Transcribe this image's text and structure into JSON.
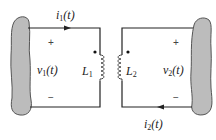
{
  "diagram": {
    "type": "coupled-inductors-circuit",
    "left_circuit": {
      "current_label": "i",
      "current_sub": "1",
      "current_arg": "(t)",
      "voltage_label": "v",
      "voltage_sub": "1",
      "voltage_arg": "(t)",
      "plus": "+",
      "minus": "−",
      "inductor_label": "L",
      "inductor_sub": "1",
      "current_direction": "right"
    },
    "right_circuit": {
      "current_label": "i",
      "current_sub": "2",
      "current_arg": "(t)",
      "voltage_label": "v",
      "voltage_sub": "2",
      "voltage_arg": "(t)",
      "plus": "+",
      "minus": "−",
      "inductor_label": "L",
      "inductor_sub": "2",
      "current_direction": "left"
    },
    "colors": {
      "wire": "#222222",
      "blob_fill": "#bcbcbc",
      "blob_stroke": "#555555"
    }
  }
}
